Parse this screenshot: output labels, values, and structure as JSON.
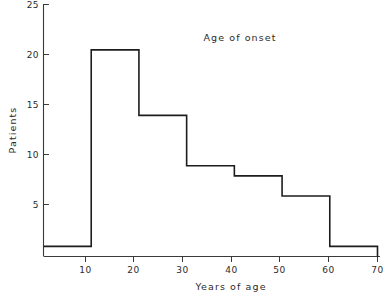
{
  "chart_data": {
    "type": "bar",
    "title": "Age of onset",
    "xlabel": "Years of age",
    "ylabel": "Patients",
    "categories": [
      "0-10",
      "10-20",
      "20-30",
      "30-40",
      "40-50",
      "50-60",
      "60-70"
    ],
    "bin_edges": [
      0,
      10,
      20,
      30,
      40,
      50,
      60,
      70
    ],
    "values": [
      1,
      20.5,
      14,
      9,
      8,
      6,
      1
    ],
    "xlim": [
      0,
      70
    ],
    "ylim": [
      0,
      25
    ],
    "xticks": [
      10,
      20,
      30,
      40,
      50,
      60,
      70
    ],
    "yticks": [
      5,
      10,
      15,
      20,
      25
    ],
    "xtick_labels": [
      "10",
      "20",
      "30",
      "40",
      "50",
      "60",
      "70"
    ],
    "ytick_labels": [
      "5",
      "10",
      "15",
      "20",
      "25"
    ],
    "grid": false,
    "legend": null,
    "style": {
      "line_color": "#1d1d1d",
      "axis_color": "#3a3a3a",
      "background": "#ffffff"
    }
  },
  "labels": {
    "title": "Age of onset",
    "x_axis_title": "Years of age",
    "y_axis_title": "Patients",
    "y_ticks": [
      "25",
      "20",
      "15",
      "10",
      "5"
    ],
    "x_ticks": [
      "10",
      "20",
      "30",
      "40",
      "50",
      "60",
      "70"
    ]
  }
}
